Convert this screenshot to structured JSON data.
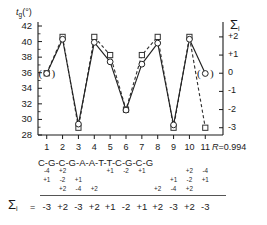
{
  "figure": {
    "left_axis_label": "t",
    "left_axis_label_sub": "g",
    "left_axis_label_unit": "(°)",
    "right_axis_label": "Σ",
    "right_axis_label_sub": "i",
    "correlation_prefix": "R",
    "correlation_equals": "=",
    "correlation_value": "0.994",
    "sum_row_label": "Σ",
    "sum_row_label_sub": "i",
    "sum_row_equals": "="
  },
  "chart_data": {
    "type": "line",
    "title": "",
    "xlabel": "",
    "ylabel": "t_g (°)",
    "y2label": "Σ_i",
    "grid": false,
    "legend": "none",
    "ylim": [
      28,
      42
    ],
    "y2lim": [
      -3.4,
      2.6
    ],
    "xlim": [
      0.45,
      11.55
    ],
    "x": [
      1,
      2,
      3,
      4,
      5,
      6,
      7,
      8,
      9,
      10,
      11
    ],
    "ytick_labels": [
      "42",
      "40",
      "38",
      "36",
      "34",
      "32",
      "30",
      "28"
    ],
    "ytick_values": [
      42,
      40,
      38,
      36,
      34,
      32,
      30,
      28
    ],
    "y2tick_labels": [
      "+2",
      "+1",
      "0",
      "-1",
      "-2",
      "-3"
    ],
    "y2tick_values": [
      2,
      1,
      0,
      -1,
      -2,
      -3
    ],
    "xtick_labels": [
      "1",
      "2",
      "3",
      "4",
      "5",
      "6",
      "7",
      "8",
      "9",
      "10",
      "11"
    ],
    "series": [
      {
        "name": "twist angle",
        "marker": "circle",
        "linestyle": "solid",
        "axis": "left",
        "values": [
          35.9,
          40.3,
          29.4,
          39.9,
          37.4,
          31.2,
          37.1,
          39.8,
          29.3,
          40.3,
          35.9
        ],
        "bracketed_points": [
          11
        ]
      },
      {
        "name": "sum of increments",
        "marker": "square",
        "linestyle": "dashed",
        "axis": "right",
        "values": [
          0,
          2,
          -3,
          2,
          1,
          -2,
          1,
          2,
          -3,
          2,
          -3
        ],
        "bracketed_points": [
          1
        ]
      }
    ],
    "sequence": [
      "C",
      "G",
      "C",
      "G",
      "A",
      "A",
      "T",
      "T",
      "C",
      "G",
      "C",
      "G"
    ],
    "sequence_text": "C-G-C-G-A-A-T-T-C-G-C-G",
    "increment_rows": [
      [
        "-4",
        "+2",
        "",
        "",
        "+1",
        "-2",
        "+1",
        "",
        "",
        "+2",
        "-4"
      ],
      [
        "+1",
        "-2",
        "+1",
        "",
        "",
        "",
        "",
        "",
        "+1",
        "-2",
        "+1"
      ],
      [
        "",
        "+2",
        "-4",
        "+2",
        "",
        "",
        "",
        "+2",
        "-4",
        "+2",
        ""
      ]
    ],
    "sums": [
      "-3",
      "+2",
      "-3",
      "+2",
      "+1",
      "-2",
      "+1",
      "+2",
      "-3",
      "+2",
      "-3"
    ],
    "annotations": [
      "R = 0.994"
    ]
  },
  "colors": {
    "ink": "#1a1a1a",
    "line_solid": "#222222",
    "line_dashed": "#333333",
    "marker_fill": "#ffffff"
  }
}
